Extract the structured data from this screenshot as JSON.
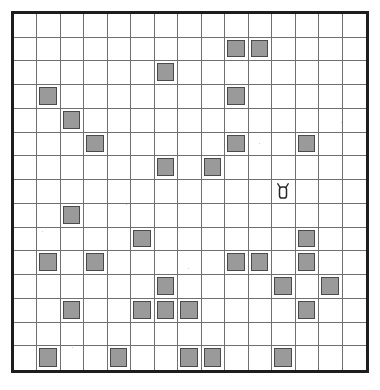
{
  "board": {
    "title": "grid-puzzle-board",
    "rows": 15,
    "cols": 15,
    "colors": {
      "border": "#1d1d1d",
      "gridline": "#6f6f6f",
      "cell_fill": "#ffffff",
      "marker_fill": "#9a9a9a",
      "marker_stroke": "#4a4a4a",
      "page_background": "#ffffff"
    },
    "marked_cells": [
      {
        "row": 1,
        "col": 9
      },
      {
        "row": 1,
        "col": 10
      },
      {
        "row": 2,
        "col": 6
      },
      {
        "row": 3,
        "col": 1
      },
      {
        "row": 3,
        "col": 9
      },
      {
        "row": 4,
        "col": 2
      },
      {
        "row": 5,
        "col": 3
      },
      {
        "row": 5,
        "col": 9
      },
      {
        "row": 5,
        "col": 12
      },
      {
        "row": 6,
        "col": 6
      },
      {
        "row": 6,
        "col": 8
      },
      {
        "row": 8,
        "col": 2
      },
      {
        "row": 9,
        "col": 5
      },
      {
        "row": 9,
        "col": 12
      },
      {
        "row": 10,
        "col": 1
      },
      {
        "row": 10,
        "col": 3
      },
      {
        "row": 10,
        "col": 9
      },
      {
        "row": 10,
        "col": 10
      },
      {
        "row": 10,
        "col": 12
      },
      {
        "row": 11,
        "col": 6
      },
      {
        "row": 11,
        "col": 11
      },
      {
        "row": 11,
        "col": 13
      },
      {
        "row": 12,
        "col": 2
      },
      {
        "row": 12,
        "col": 5
      },
      {
        "row": 12,
        "col": 6
      },
      {
        "row": 12,
        "col": 7
      },
      {
        "row": 12,
        "col": 12
      },
      {
        "row": 14,
        "col": 1
      },
      {
        "row": 14,
        "col": 4
      },
      {
        "row": 14,
        "col": 7
      },
      {
        "row": 14,
        "col": 8
      },
      {
        "row": 14,
        "col": 11
      }
    ],
    "icons": [
      {
        "row": 7,
        "col": 11,
        "name": "mouse-icon"
      }
    ],
    "specks": [
      {
        "x": 42,
        "y": 231
      },
      {
        "x": 126,
        "y": 204
      },
      {
        "x": 259,
        "y": 143
      },
      {
        "x": 188,
        "y": 268
      },
      {
        "x": 341,
        "y": 122
      },
      {
        "x": 72,
        "y": 347
      }
    ]
  }
}
